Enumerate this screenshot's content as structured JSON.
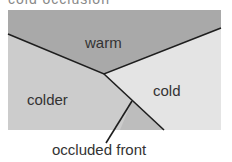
{
  "caption_top": "cold occlusion",
  "regions": {
    "warm": "warm",
    "cold": "cold",
    "colder": "colder"
  },
  "annotation": "occluded front",
  "colors": {
    "warm": "#a9a9a9",
    "cold": "#e4e4e4",
    "colder": "#cccccc",
    "wedge": "#bdbdbd",
    "line": "#1e1e1e",
    "text": "#333333"
  }
}
